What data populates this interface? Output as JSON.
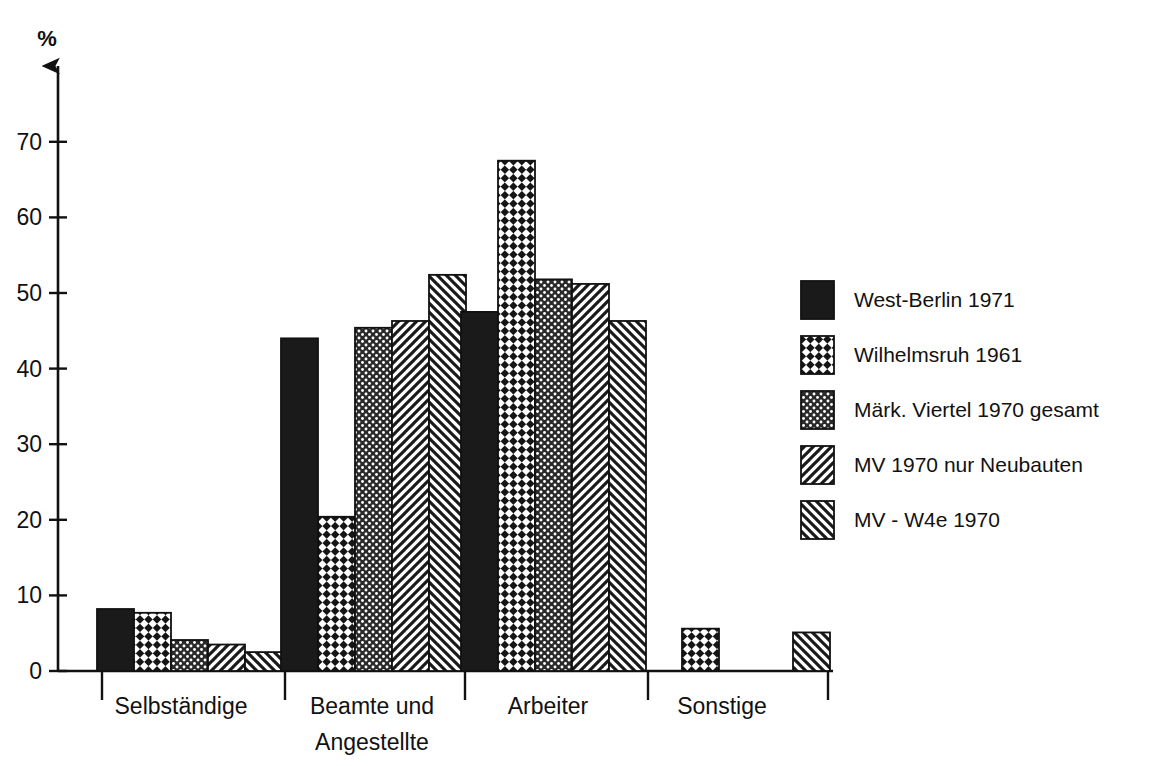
{
  "chart_data": {
    "type": "bar",
    "title": "",
    "subtitle": "",
    "xlabel": "",
    "ylabel": "%",
    "ylim": [
      0,
      78
    ],
    "grid": false,
    "legend_position": "right",
    "yticks": [
      0,
      10,
      20,
      30,
      40,
      50,
      60,
      70
    ],
    "ytick_labels": [
      "0",
      "10",
      "20",
      "30",
      "40",
      "50",
      "60",
      "70"
    ],
    "categories": [
      "Selbständige",
      "Beamte und Angestellte",
      "Arbeiter",
      "Sonstige"
    ],
    "category_label_lines": [
      [
        "Selbständige"
      ],
      [
        "Beamte und",
        "Angestellte"
      ],
      [
        "Arbeiter"
      ],
      [
        "Sonstige"
      ]
    ],
    "series": [
      {
        "name": "West-Berlin 1971",
        "pattern": "solid-black",
        "values": [
          8.2,
          44.0,
          47.5,
          null
        ]
      },
      {
        "name": "Wilhelmsruh 1961",
        "pattern": "checker",
        "values": [
          7.7,
          20.4,
          67.5,
          5.6
        ]
      },
      {
        "name": "Märk. Viertel 1970 gesamt",
        "pattern": "dots",
        "values": [
          4.1,
          45.4,
          51.8,
          null
        ]
      },
      {
        "name": "MV 1970 nur Neubauten",
        "pattern": "hatch-forward",
        "values": [
          3.5,
          46.3,
          51.2,
          null
        ]
      },
      {
        "name": "MV - W4e 1970",
        "pattern": "hatch-back",
        "values": [
          2.5,
          52.4,
          46.3,
          5.1
        ]
      }
    ]
  },
  "axis": {
    "y_unit_label": "%"
  },
  "legend": {
    "items": [
      {
        "label": "West-Berlin 1971",
        "pattern": "solid-black"
      },
      {
        "label": "Wilhelmsruh 1961",
        "pattern": "checker"
      },
      {
        "label": "Märk. Viertel 1970 gesamt",
        "pattern": "dots"
      },
      {
        "label": "MV 1970 nur Neubauten",
        "pattern": "hatch-forward"
      },
      {
        "label": "MV - W4e 1970",
        "pattern": "hatch-back"
      }
    ]
  },
  "colors": {
    "ink": "#111111",
    "background": "#ffffff",
    "bar_fill_solid": "#1a1a1a",
    "bar_outline": "#111111"
  }
}
